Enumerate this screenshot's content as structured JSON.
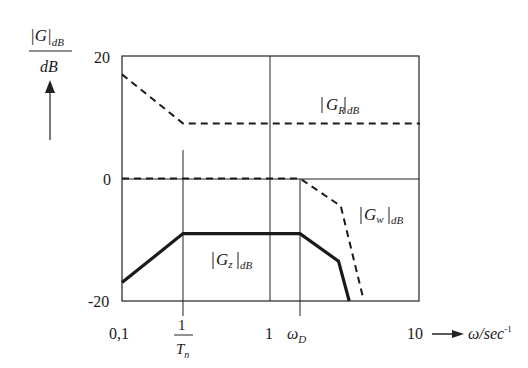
{
  "chart_data": {
    "type": "line",
    "title": "",
    "ylabel": {
      "num": "|G|",
      "sub": "dB",
      "den": "dB"
    },
    "xlabel": {
      "text": "ω/sec",
      "sup": "-1"
    },
    "x_scale": "log",
    "xlim": [
      0.1,
      10
    ],
    "ylim": [
      -20,
      20
    ],
    "yticks": [
      "20",
      "0",
      "-20"
    ],
    "xticks": [
      {
        "label": "0,1",
        "value": 0.1
      },
      {
        "label": "1/Tn",
        "num": "1",
        "den": "T",
        "den_sub": "n",
        "value": 0.3
      },
      {
        "label": "1",
        "value": 1
      },
      {
        "label": "ωD",
        "main": "ω",
        "sub": "D",
        "value": 1.3
      },
      {
        "label": "10",
        "value": 10
      }
    ],
    "grid": false,
    "series": [
      {
        "name": "|G_R|dB",
        "label_main": "G",
        "label_sub": "R",
        "label_post": "dB",
        "style": "dashed",
        "points": [
          [
            0.1,
            17
          ],
          [
            0.3,
            9
          ],
          [
            10,
            9
          ]
        ]
      },
      {
        "name": "|G_w|dB",
        "label_main": "G",
        "label_sub": "w",
        "label_post": "dB",
        "style": "dashed",
        "points": [
          [
            0.1,
            0
          ],
          [
            1.3,
            0
          ],
          [
            2.6,
            -4.5
          ],
          [
            3.8,
            -19.5
          ]
        ]
      },
      {
        "name": "|G_z|dB",
        "label_main": "G",
        "label_sub": "z",
        "label_post": "dB",
        "style": "solid-bold",
        "points": [
          [
            0.1,
            -17
          ],
          [
            0.3,
            -9
          ],
          [
            1.3,
            -9
          ],
          [
            2.5,
            -13.5
          ],
          [
            3.0,
            -20
          ]
        ]
      }
    ],
    "reference_lines": {
      "horizontal": [
        0
      ],
      "vertical": [
        0.3,
        1,
        1.3
      ]
    }
  }
}
